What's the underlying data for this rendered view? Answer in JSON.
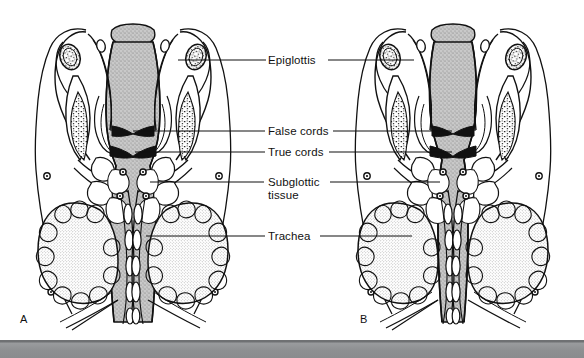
{
  "figure": {
    "kind": "anatomical-illustration",
    "background_color": "#ffffff",
    "line_color": "#000000",
    "airway_fill_color": "#b9b9b9",
    "panels": [
      {
        "letter": "A",
        "label": "A",
        "airway_state": "normal-caliber-airway"
      },
      {
        "letter": "B",
        "label": "B",
        "airway_state": "narrowed-subglottic-airway"
      }
    ],
    "callouts": [
      {
        "id": "epiglottis",
        "label": "Epiglottis",
        "has_left_leader": true,
        "has_right_leader": true
      },
      {
        "id": "false-cords",
        "label": "False cords",
        "has_left_leader": true,
        "has_right_leader": true
      },
      {
        "id": "true-cords",
        "label": "True cords",
        "has_left_leader": true,
        "has_right_leader": true
      },
      {
        "id": "subglottic-tissue",
        "label": "Subglottic\ntissue",
        "line1": "Subglottic",
        "line2": "tissue",
        "has_left_leader": true,
        "has_right_leader": true
      },
      {
        "id": "trachea",
        "label": "Trachea",
        "has_left_leader": true,
        "has_right_leader": true
      }
    ],
    "footer_band": {
      "color": "#8c8e90",
      "top_edge_color": "#6f7173"
    }
  }
}
